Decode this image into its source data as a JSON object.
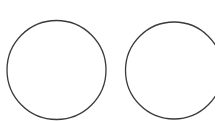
{
  "canvas": {
    "width": 215,
    "height": 121,
    "background": "#ffffff"
  },
  "shapes": {
    "stroke_color": "#3a3a3a",
    "stroke_width": 1.3,
    "circles": [
      {
        "name": "left-circle",
        "cx": 56.5,
        "cy": 70,
        "r": 49.5
      },
      {
        "name": "right-circle",
        "cx": 174,
        "cy": 70.5,
        "r": 48.5
      }
    ]
  }
}
